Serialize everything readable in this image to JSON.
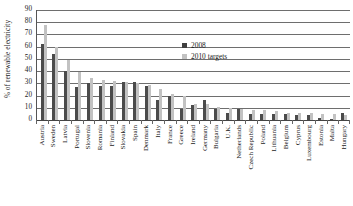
{
  "chart_data": {
    "type": "bar",
    "title": "",
    "xlabel": "",
    "ylabel": "% of renewable electricity",
    "ylim": [
      0,
      90
    ],
    "yticks": [
      0,
      10,
      20,
      30,
      40,
      50,
      60,
      70,
      80,
      90
    ],
    "grid": true,
    "legend_position": "upper-center-right",
    "categories": [
      "Austria",
      "Sweden",
      "Latvia",
      "Portugal",
      "Slovenia",
      "Romania",
      "Finland",
      "Slovakia",
      "Spain",
      "Denmark",
      "Italy",
      "France",
      "Greece",
      "Ireland",
      "Germany",
      "Bulgaria",
      "U.K.",
      "Netherlands",
      "Czech Republic",
      "Poland",
      "Lithuania",
      "Belgium",
      "Cyprus",
      "Luxembourg",
      "Estonia",
      "Malta",
      "Hungary"
    ],
    "series": [
      {
        "name": "2008",
        "color": "#4b4b4b",
        "values": [
          62,
          54,
          40,
          27,
          30,
          28,
          28,
          31,
          31,
          28,
          16,
          20,
          9,
          12,
          16,
          9,
          6,
          9,
          5,
          5,
          5,
          5,
          4,
          4,
          2,
          1,
          6
        ]
      },
      {
        "name": "2010 targets",
        "color": "#c2c2c2",
        "values": [
          78,
          60,
          49,
          39,
          34,
          33,
          32,
          31,
          30,
          29,
          25,
          21,
          20,
          13,
          13,
          11,
          10,
          9,
          8,
          8,
          7,
          6,
          6,
          6,
          5,
          5,
          4
        ]
      }
    ]
  },
  "legend": {
    "entries": [
      {
        "label": "2008",
        "swatch": "dark-square-swatch"
      },
      {
        "label": "2010 targets",
        "swatch": "light-square-swatch"
      }
    ]
  },
  "colors": {
    "series_2008": "#4b4b4b",
    "series_2010_targets": "#c2c2c2",
    "gridline": "#6e6e6e",
    "axis": "#555555",
    "background": "#ffffff",
    "text": "#1a1a1a"
  }
}
